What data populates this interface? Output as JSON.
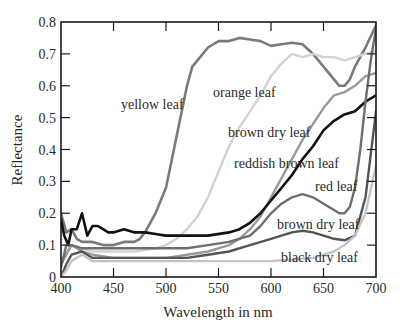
{
  "chart_data": {
    "type": "line",
    "title": "",
    "xlabel": "Wavelength in nm",
    "ylabel": "Reflectance",
    "xlim": [
      400,
      700
    ],
    "ylim": [
      0,
      0.8
    ],
    "xticks": [
      400,
      450,
      500,
      550,
      600,
      650,
      700
    ],
    "xtick_labels": [
      "400",
      "450",
      "500",
      "550",
      "600",
      "650",
      "700"
    ],
    "yticks": [
      0,
      0.1,
      0.2,
      0.3,
      0.4,
      0.5,
      0.6,
      0.7,
      0.8
    ],
    "ytick_labels": [
      "0",
      "0.1",
      "0.2",
      "0.3",
      "0.4",
      "0.5",
      "0.6",
      "0.7",
      "0.8"
    ],
    "grid": false,
    "legend_position": "inline labels",
    "series": [
      {
        "name": "yellow leaf",
        "color": "#7a7a7a",
        "width": 2.6,
        "x": [
          400,
          405,
          410,
          415,
          420,
          430,
          440,
          450,
          460,
          470,
          475,
          480,
          490,
          500,
          505,
          510,
          515,
          520,
          525,
          530,
          540,
          550,
          560,
          570,
          580,
          590,
          600,
          610,
          620,
          630,
          640,
          650,
          660,
          665,
          670,
          675,
          680,
          690,
          700
        ],
        "y": [
          0.2,
          0.14,
          0.15,
          0.12,
          0.11,
          0.11,
          0.1,
          0.1,
          0.11,
          0.11,
          0.12,
          0.14,
          0.2,
          0.28,
          0.36,
          0.44,
          0.52,
          0.6,
          0.66,
          0.68,
          0.72,
          0.74,
          0.74,
          0.75,
          0.745,
          0.74,
          0.725,
          0.73,
          0.735,
          0.73,
          0.7,
          0.66,
          0.62,
          0.6,
          0.6,
          0.62,
          0.66,
          0.72,
          0.79
        ]
      },
      {
        "name": "orange leaf",
        "color": "#d2d2d2",
        "width": 2.4,
        "x": [
          400,
          410,
          420,
          430,
          450,
          470,
          490,
          500,
          510,
          520,
          530,
          540,
          550,
          560,
          570,
          580,
          590,
          600,
          610,
          620,
          630,
          640,
          650,
          660,
          670,
          680,
          690,
          700
        ],
        "y": [
          0.05,
          0.1,
          0.09,
          0.08,
          0.08,
          0.08,
          0.09,
          0.1,
          0.12,
          0.15,
          0.19,
          0.25,
          0.33,
          0.41,
          0.47,
          0.52,
          0.57,
          0.63,
          0.67,
          0.7,
          0.69,
          0.7,
          0.69,
          0.69,
          0.68,
          0.69,
          0.7,
          0.71
        ]
      },
      {
        "name": "brown dry leaf (upper)",
        "color": "#9a9a9a",
        "width": 2.4,
        "x": [
          400,
          410,
          420,
          430,
          450,
          480,
          500,
          520,
          540,
          560,
          570,
          580,
          590,
          600,
          610,
          620,
          630,
          640,
          650,
          660,
          670,
          680,
          690,
          700
        ],
        "y": [
          0.04,
          0.1,
          0.08,
          0.07,
          0.06,
          0.06,
          0.06,
          0.07,
          0.08,
          0.1,
          0.12,
          0.15,
          0.19,
          0.25,
          0.31,
          0.37,
          0.43,
          0.48,
          0.53,
          0.57,
          0.58,
          0.6,
          0.63,
          0.64
        ]
      },
      {
        "name": "reddish brown leaf",
        "color": "#111111",
        "width": 2.6,
        "x": [
          400,
          403,
          407,
          410,
          415,
          420,
          425,
          430,
          435,
          440,
          445,
          450,
          460,
          470,
          480,
          490,
          500,
          520,
          540,
          560,
          570,
          580,
          590,
          600,
          610,
          620,
          630,
          640,
          650,
          660,
          670,
          680,
          690,
          700
        ],
        "y": [
          0.18,
          0.13,
          0.1,
          0.15,
          0.15,
          0.2,
          0.13,
          0.16,
          0.16,
          0.15,
          0.14,
          0.14,
          0.15,
          0.14,
          0.14,
          0.135,
          0.13,
          0.13,
          0.13,
          0.14,
          0.15,
          0.17,
          0.2,
          0.24,
          0.28,
          0.32,
          0.37,
          0.41,
          0.46,
          0.49,
          0.51,
          0.52,
          0.55,
          0.57
        ]
      },
      {
        "name": "red leaf",
        "color": "#6e6e6e",
        "width": 2.4,
        "x": [
          400,
          405,
          410,
          420,
          430,
          450,
          480,
          500,
          520,
          540,
          560,
          580,
          590,
          600,
          610,
          620,
          630,
          640,
          650,
          660,
          665,
          670,
          675,
          680,
          685,
          690,
          695,
          700
        ],
        "y": [
          0.03,
          0.1,
          0.1,
          0.09,
          0.09,
          0.09,
          0.09,
          0.09,
          0.09,
          0.1,
          0.11,
          0.13,
          0.16,
          0.2,
          0.23,
          0.25,
          0.26,
          0.25,
          0.23,
          0.21,
          0.2,
          0.2,
          0.22,
          0.28,
          0.4,
          0.55,
          0.68,
          0.78
        ]
      },
      {
        "name": "brown dry leaf (lower)",
        "color": "#555555",
        "width": 2.4,
        "x": [
          400,
          405,
          410,
          420,
          430,
          450,
          480,
          500,
          520,
          540,
          560,
          580,
          600,
          610,
          620,
          630,
          640,
          650,
          660,
          670,
          680,
          690,
          700
        ],
        "y": [
          0.0,
          0.04,
          0.07,
          0.08,
          0.06,
          0.06,
          0.06,
          0.06,
          0.06,
          0.07,
          0.08,
          0.1,
          0.12,
          0.13,
          0.14,
          0.145,
          0.14,
          0.13,
          0.12,
          0.115,
          0.13,
          0.25,
          0.52
        ]
      },
      {
        "name": "black dry leaf",
        "color": "#c4c4c4",
        "width": 2.4,
        "x": [
          400,
          405,
          410,
          420,
          430,
          450,
          480,
          500,
          520,
          540,
          560,
          580,
          600,
          620,
          640,
          660,
          670,
          680,
          690,
          700
        ],
        "y": [
          0.0,
          0.02,
          0.05,
          0.07,
          0.05,
          0.05,
          0.05,
          0.05,
          0.05,
          0.05,
          0.05,
          0.05,
          0.05,
          0.055,
          0.06,
          0.08,
          0.1,
          0.13,
          0.2,
          0.35
        ]
      }
    ],
    "annotations": [
      {
        "text": "yellow leaf",
        "x_px": 121,
        "y_px": 109
      },
      {
        "text": "orange leaf",
        "x_px": 213,
        "y_px": 97
      },
      {
        "text": "brown dry leaf",
        "x_px": 228,
        "y_px": 137
      },
      {
        "text": "reddish brown leaf",
        "x_px": 234,
        "y_px": 168
      },
      {
        "text": "red leaf",
        "x_px": 315,
        "y_px": 191
      },
      {
        "text": "brown dry leaf",
        "x_px": 277,
        "y_px": 229
      },
      {
        "text": "black dry leaf",
        "x_px": 281,
        "y_px": 262
      }
    ]
  },
  "layout": {
    "plot_left": 61,
    "plot_right": 376,
    "plot_top": 22,
    "plot_bottom": 277
  }
}
